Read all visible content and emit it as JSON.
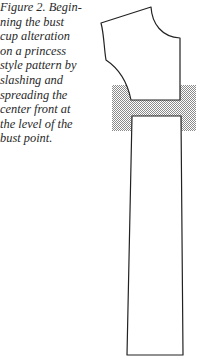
{
  "figure": {
    "caption_lines": [
      "Figure 2. Begin-",
      "ning the bust",
      "cup alteration",
      "on a princess",
      "style pattern by",
      "slashing and",
      "spreading the",
      "center front at",
      "the level of the",
      "bust point."
    ],
    "caption_full": "Figure 2. Beginning the bust cup alteration on a princess style pattern by slashing and spreading the center front at the level of the bust point.",
    "diagram": {
      "upper_piece": "bodice-upper-pattern",
      "lower_piece": "bodice-lower-pattern",
      "spread_region": "hatched-spread-area",
      "line_color": "#222222",
      "hatch_color": "#9a9a9a"
    }
  }
}
